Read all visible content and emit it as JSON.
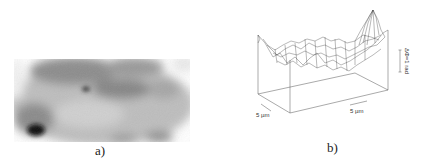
{
  "figure": {
    "panel_a": {
      "caption": "a)",
      "description": "grayscale phase image"
    },
    "panel_b": {
      "caption": "b)",
      "description": "3D wireframe surface plot",
      "x_scale_label": "5 µm",
      "y_scale_label": "5 µm",
      "z_scale_label": "ΔΦ=1 rad"
    }
  }
}
